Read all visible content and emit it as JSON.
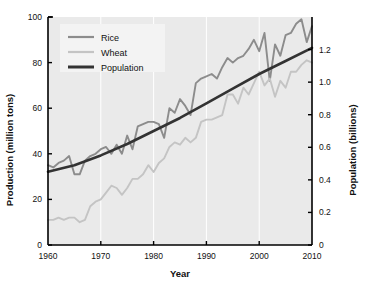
{
  "chart_data": {
    "type": "line",
    "title": "",
    "xlabel": "Year",
    "ylabel": "Production (million tons)",
    "y2label": "Population (billions)",
    "xlim": [
      1960,
      2010
    ],
    "ylim": [
      0,
      100
    ],
    "y2lim": [
      0,
      1.4
    ],
    "xticks": [
      1960,
      1970,
      1980,
      1990,
      2000,
      2010
    ],
    "yticks": [
      0,
      20,
      40,
      60,
      80,
      100
    ],
    "y2ticks": [
      0,
      0.2,
      0.4,
      0.6,
      0.8,
      1.0,
      1.2
    ],
    "grid": "vertical-only",
    "plot_background": "#eaeaea",
    "legend_position": "top-left",
    "legend_background": "#f3f3f3",
    "series": [
      {
        "name": "Rice",
        "axis": "left",
        "color": "#8c8c8c",
        "units": "million tons",
        "x": [
          1960,
          1961,
          1962,
          1963,
          1964,
          1965,
          1966,
          1967,
          1968,
          1969,
          1970,
          1971,
          1972,
          1973,
          1974,
          1975,
          1976,
          1977,
          1978,
          1979,
          1980,
          1981,
          1982,
          1983,
          1984,
          1985,
          1986,
          1987,
          1988,
          1989,
          1990,
          1991,
          1992,
          1993,
          1994,
          1995,
          1996,
          1997,
          1998,
          1999,
          2000,
          2001,
          2002,
          2003,
          2004,
          2005,
          2006,
          2007,
          2008,
          2009,
          2010
        ],
        "values": [
          35,
          34,
          36,
          37,
          39,
          31,
          31,
          37,
          39,
          40,
          42,
          43,
          40,
          44,
          40,
          48,
          42,
          52,
          53,
          54,
          54,
          53,
          47,
          60,
          58,
          64,
          61,
          57,
          71,
          73,
          74,
          75,
          73,
          78,
          82,
          80,
          82,
          83,
          86,
          90,
          85,
          93,
          72,
          88,
          83,
          92,
          93,
          97,
          99,
          89,
          96
        ]
      },
      {
        "name": "Wheat",
        "axis": "left",
        "color": "#c4c4c4",
        "units": "million tons",
        "x": [
          1960,
          1961,
          1962,
          1963,
          1964,
          1965,
          1966,
          1967,
          1968,
          1969,
          1970,
          1971,
          1972,
          1973,
          1974,
          1975,
          1976,
          1977,
          1978,
          1979,
          1980,
          1981,
          1982,
          1983,
          1984,
          1985,
          1986,
          1987,
          1988,
          1989,
          1990,
          1991,
          1992,
          1993,
          1994,
          1995,
          1996,
          1997,
          1998,
          1999,
          2000,
          2001,
          2002,
          2003,
          2004,
          2005,
          2006,
          2007,
          2008,
          2009,
          2010
        ],
        "values": [
          11,
          11,
          12,
          11,
          12,
          12,
          10,
          11,
          17,
          19,
          20,
          23,
          26,
          25,
          22,
          25,
          29,
          29,
          31,
          35,
          32,
          36,
          38,
          43,
          45,
          44,
          47,
          45,
          47,
          54,
          55,
          55,
          56,
          57,
          66,
          66,
          62,
          69,
          66,
          71,
          76,
          70,
          73,
          65,
          72,
          69,
          76,
          76,
          79,
          81,
          80
        ]
      },
      {
        "name": "Population",
        "axis": "right",
        "color": "#333333",
        "units": "billions",
        "x": [
          1960,
          1965,
          1970,
          1975,
          1980,
          1985,
          1990,
          1995,
          2000,
          2005,
          2010
        ],
        "values": [
          0.45,
          0.49,
          0.55,
          0.62,
          0.7,
          0.78,
          0.87,
          0.96,
          1.05,
          1.13,
          1.21
        ]
      }
    ]
  }
}
